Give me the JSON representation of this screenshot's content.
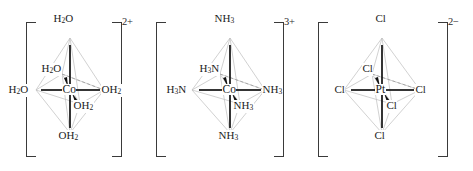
{
  "diagram": {
    "complexes": [
      {
        "id": "hexaaquacobalt",
        "center": "Co",
        "charge": "2+",
        "bracket_left": "[",
        "bracket_right": "]",
        "ligands": {
          "top": "H₂O",
          "bottom": "OH₂",
          "left": "H₂O",
          "right": "OH₂",
          "back": "H₂O",
          "front": "OH₂"
        },
        "labels": {
          "top": {
            "sym": "H",
            "sub": "2",
            "tail": "O"
          },
          "back": {
            "sym": "H",
            "sub": "2",
            "tail": "O"
          },
          "left": {
            "sym": "H",
            "sub": "2",
            "tail": "O"
          },
          "right": {
            "sym": "OH",
            "sub": "2",
            "tail": ""
          },
          "front": {
            "sym": "OH",
            "sub": "2",
            "tail": ""
          },
          "bottom": {
            "sym": "OH",
            "sub": "2",
            "tail": ""
          }
        }
      },
      {
        "id": "hexaamminecobalt",
        "center": "Co",
        "charge": "3+",
        "bracket_left": "[",
        "bracket_right": "]",
        "ligands": {
          "top": "NH₃",
          "bottom": "NH₃",
          "left": "H₃N",
          "right": "NH₃",
          "back": "H₃N",
          "front": "NH₃"
        },
        "labels": {
          "top": {
            "sym": "NH",
            "sub": "3",
            "tail": ""
          },
          "back": {
            "sym": "H",
            "sub": "3",
            "tail": "N"
          },
          "left": {
            "sym": "H",
            "sub": "3",
            "tail": "N"
          },
          "right": {
            "sym": "NH",
            "sub": "3",
            "tail": ""
          },
          "front": {
            "sym": "NH",
            "sub": "3",
            "tail": ""
          },
          "bottom": {
            "sym": "NH",
            "sub": "3",
            "tail": ""
          }
        }
      },
      {
        "id": "hexachloroplatinate",
        "center": "Pt",
        "charge": "2−",
        "bracket_left": "[",
        "bracket_right": "]",
        "ligands": {
          "top": "Cl",
          "bottom": "Cl",
          "left": "Cl",
          "right": "Cl",
          "back": "Cl",
          "front": "Cl"
        },
        "labels": {
          "top": {
            "sym": "Cl",
            "sub": "",
            "tail": ""
          },
          "back": {
            "sym": "Cl",
            "sub": "",
            "tail": ""
          },
          "left": {
            "sym": "Cl",
            "sub": "",
            "tail": ""
          },
          "right": {
            "sym": "Cl",
            "sub": "",
            "tail": ""
          },
          "front": {
            "sym": "Cl",
            "sub": "",
            "tail": ""
          },
          "bottom": {
            "sym": "Cl",
            "sub": "",
            "tail": ""
          }
        }
      }
    ],
    "colors": {
      "bond_solid": "#111111",
      "bond_faint": "#b9b9b9",
      "bond_dashed": "#9a9a9a",
      "text": "#1c1c1c",
      "bracket": "#3a3a3a",
      "background": "#ffffff"
    }
  }
}
